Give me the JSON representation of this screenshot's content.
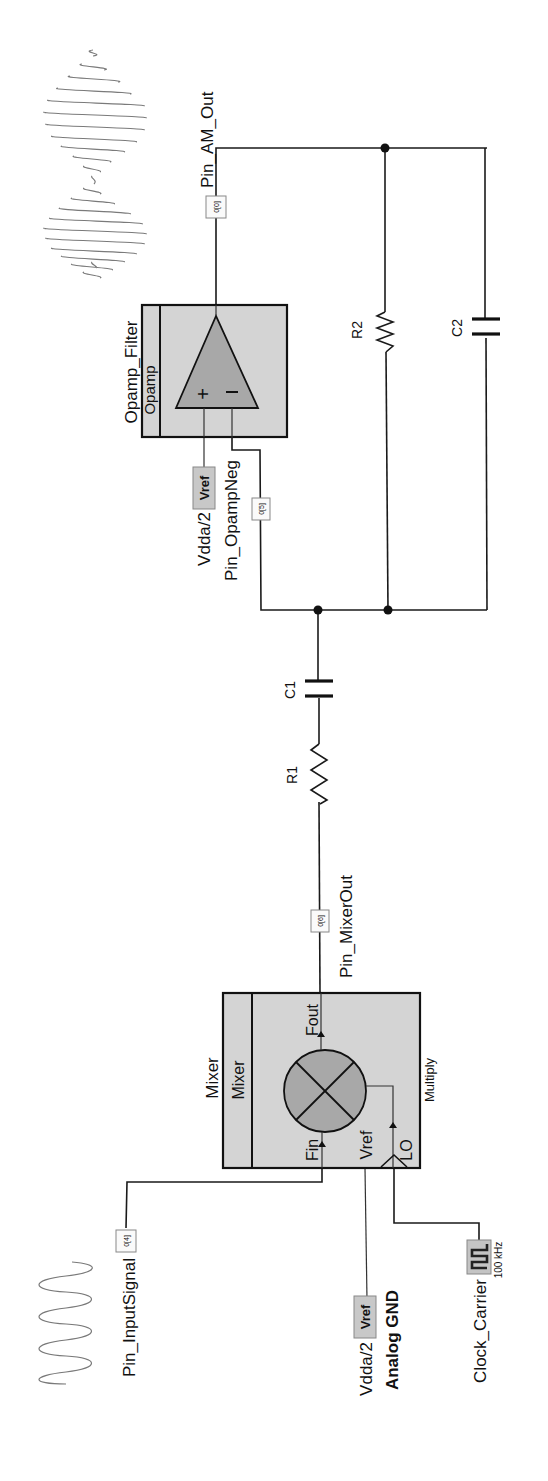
{
  "schematic": {
    "orientation": "rotated-90-ccw",
    "components": {
      "opamp": {
        "instance_name": "Opamp_Filter",
        "type_label": "Opamp",
        "plus": "+",
        "minus": "−"
      },
      "mixer": {
        "instance_name": "Mixer",
        "type_label": "Mixer",
        "mode": "Multiply",
        "pins": {
          "fin": "Fin",
          "fout": "Fout",
          "vref": "Vref",
          "lo": "LO"
        }
      },
      "r1": {
        "label": "R1"
      },
      "r2": {
        "label": "R2"
      },
      "c1": {
        "label": "C1"
      },
      "c2": {
        "label": "C2"
      },
      "clock": {
        "name": "Clock_Carrier",
        "frequency": "100 kHz"
      },
      "vref_opamp": {
        "box": "Vref",
        "value": "Vdda/2"
      },
      "vref_mixer": {
        "box": "Vref",
        "value": "Vdda/2",
        "name": "Analog GND"
      }
    },
    "pins": {
      "am_out": {
        "name": "Pin_AM_Out",
        "port": "0[0]"
      },
      "opamp_neg": {
        "name": "Pin_OpampNeg",
        "port": "0[5]"
      },
      "mixer_out": {
        "name": "Pin_MixerOut",
        "port": "0[6]"
      },
      "input_signal": {
        "name": "Pin_InputSignal",
        "port": "0[4]"
      }
    },
    "waveforms": {
      "input": "sine-wave-icon",
      "output": "am-modulated-wave-icon"
    },
    "colors": {
      "block_fill": "#d4d4d4",
      "symbol_fill": "#a8a8a8",
      "wire": "#1a1a1a",
      "background": "#ffffff"
    }
  }
}
